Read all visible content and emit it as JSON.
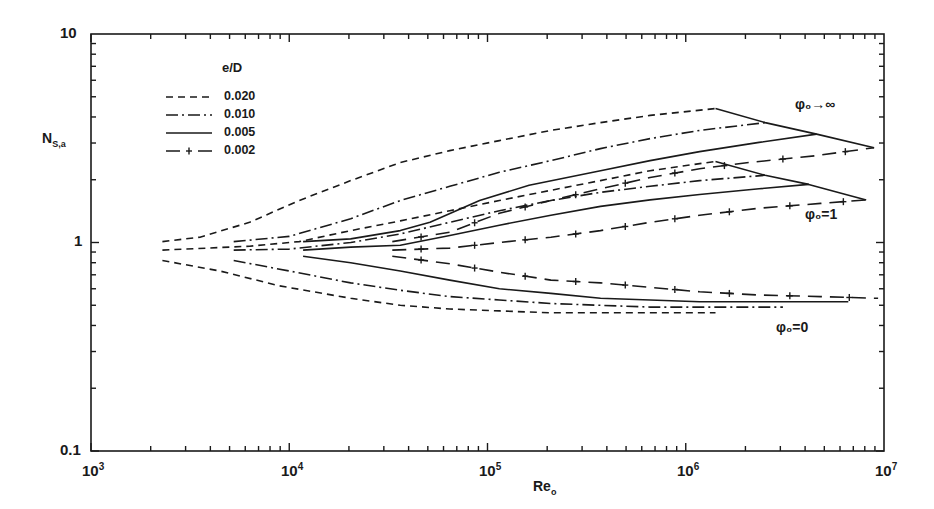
{
  "chart_data": {
    "type": "line",
    "title": "",
    "xlabel": "Re_o",
    "ylabel": "N_S,a",
    "xscale": "log",
    "yscale": "log",
    "xlim": [
      1000,
      10000000
    ],
    "ylim": [
      0.1,
      10
    ],
    "grid": false,
    "x_tick_labels": [
      "10^3",
      "10^4",
      "10^5",
      "10^6",
      "10^7"
    ],
    "y_tick_labels": [
      "0.1",
      "1",
      "10"
    ],
    "legend": {
      "title": "e/D",
      "position": "upper-left",
      "entries": [
        {
          "label": "0.020",
          "style": "dashed"
        },
        {
          "label": "0.010",
          "style": "dashdot"
        },
        {
          "label": "0.005",
          "style": "solid"
        },
        {
          "label": "0.002",
          "style": "dash-plus"
        }
      ]
    },
    "annotations": [
      {
        "text": "φo→∞",
        "near": "upper curve family"
      },
      {
        "text": "φo=1",
        "near": "middle curve family"
      },
      {
        "text": "φo=0",
        "near": "lower curve family"
      }
    ],
    "series": [
      {
        "name": "φo→∞, e/D=0.020",
        "style": "dashed",
        "logRe": [
          3.36,
          3.55,
          3.8,
          4.05,
          4.31,
          4.56,
          4.81,
          5.06,
          5.32,
          5.57,
          5.82,
          6.15
        ],
        "N": [
          1.01,
          1.06,
          1.25,
          1.59,
          1.98,
          2.42,
          2.76,
          3.08,
          3.45,
          3.76,
          4.07,
          4.39
        ]
      },
      {
        "name": "φo→∞, e/D=0.010",
        "style": "dashdot",
        "logRe": [
          3.72,
          4.0,
          4.31,
          4.56,
          4.81,
          5.06,
          5.32,
          5.57,
          5.82,
          6.07,
          6.4
        ],
        "N": [
          1.01,
          1.07,
          1.3,
          1.59,
          1.86,
          2.17,
          2.47,
          2.82,
          3.15,
          3.45,
          3.76
        ]
      },
      {
        "name": "φo→∞, e/D=0.005",
        "style": "solid",
        "logRe": [
          4.07,
          4.31,
          4.56,
          4.71,
          4.96,
          5.21,
          5.57,
          5.82,
          6.07,
          6.37,
          6.66
        ],
        "N": [
          1.01,
          1.04,
          1.14,
          1.25,
          1.59,
          1.88,
          2.21,
          2.47,
          2.73,
          3.02,
          3.31
        ]
      },
      {
        "name": "φo→∞, e/D=0.002",
        "style": "dash-plus",
        "logRe": [
          4.52,
          4.81,
          5.06,
          5.32,
          5.57,
          5.82,
          6.07,
          6.32,
          6.66,
          6.95
        ],
        "N": [
          1.01,
          1.12,
          1.38,
          1.59,
          1.81,
          2.05,
          2.26,
          2.42,
          2.61,
          2.85
        ]
      },
      {
        "name": "φo=1, e/D=0.020",
        "style": "dashed",
        "logRe": [
          3.36,
          3.8,
          4.05,
          4.31,
          4.56,
          4.81,
          5.06,
          5.32,
          5.57,
          5.82,
          6.15
        ],
        "N": [
          0.92,
          0.96,
          1.01,
          1.14,
          1.27,
          1.42,
          1.59,
          1.78,
          1.98,
          2.21,
          2.45
        ]
      },
      {
        "name": "φo=1, e/D=0.010",
        "style": "dashdot",
        "logRe": [
          3.72,
          4.0,
          4.31,
          4.56,
          4.81,
          5.06,
          5.32,
          5.57,
          5.82,
          6.07,
          6.4
        ],
        "N": [
          0.92,
          0.93,
          1.0,
          1.1,
          1.25,
          1.42,
          1.59,
          1.74,
          1.86,
          1.98,
          2.1
        ]
      },
      {
        "name": "φo=1, e/D=0.005",
        "style": "solid",
        "logRe": [
          4.07,
          4.31,
          4.56,
          4.81,
          5.06,
          5.32,
          5.57,
          5.82,
          6.07,
          6.37,
          6.62
        ],
        "N": [
          0.92,
          0.95,
          0.97,
          1.08,
          1.21,
          1.35,
          1.49,
          1.6,
          1.7,
          1.81,
          1.9
        ]
      },
      {
        "name": "φo=1, e/D=0.002",
        "style": "dash-plus",
        "logRe": [
          4.52,
          4.81,
          5.06,
          5.32,
          5.57,
          5.82,
          6.07,
          6.37,
          6.68,
          6.91
        ],
        "N": [
          0.92,
          0.94,
          1.0,
          1.06,
          1.14,
          1.25,
          1.35,
          1.46,
          1.54,
          1.6
        ]
      },
      {
        "name": "φo=0, e/D=0.020",
        "style": "dashed",
        "logRe": [
          3.36,
          3.65,
          3.95,
          4.31,
          4.56,
          4.81,
          5.06,
          5.32,
          5.57,
          6.15
        ],
        "N": [
          0.82,
          0.73,
          0.62,
          0.54,
          0.5,
          0.48,
          0.47,
          0.46,
          0.46,
          0.46
        ]
      },
      {
        "name": "φo=0, e/D=0.010",
        "style": "dashdot",
        "logRe": [
          3.72,
          4.0,
          4.31,
          4.56,
          4.81,
          5.06,
          5.32,
          5.57,
          5.82,
          6.07,
          6.49
        ],
        "N": [
          0.82,
          0.73,
          0.64,
          0.59,
          0.55,
          0.53,
          0.51,
          0.5,
          0.49,
          0.49,
          0.49
        ]
      },
      {
        "name": "φo=0, e/D=0.005",
        "style": "solid",
        "logRe": [
          4.07,
          4.31,
          4.56,
          4.81,
          5.06,
          5.32,
          5.57,
          5.82,
          6.07,
          6.37,
          6.82
        ],
        "N": [
          0.86,
          0.8,
          0.73,
          0.66,
          0.6,
          0.57,
          0.54,
          0.53,
          0.52,
          0.52,
          0.52
        ]
      },
      {
        "name": "φo=0, e/D=0.002",
        "style": "dash-plus",
        "logRe": [
          4.52,
          4.81,
          5.06,
          5.32,
          5.57,
          5.82,
          6.07,
          6.37,
          6.68,
          6.97
        ],
        "N": [
          0.86,
          0.79,
          0.72,
          0.66,
          0.64,
          0.61,
          0.58,
          0.56,
          0.55,
          0.54
        ]
      }
    ],
    "connectors": [
      {
        "name": "φo→∞ envelope",
        "style": "solid",
        "logRe": [
          6.15,
          6.4,
          6.66,
          6.95
        ],
        "N": [
          4.39,
          3.76,
          3.31,
          2.85
        ]
      },
      {
        "name": "φo=1 envelope",
        "style": "solid",
        "logRe": [
          6.15,
          6.4,
          6.62,
          6.91
        ],
        "N": [
          2.45,
          2.1,
          1.9,
          1.6
        ]
      }
    ]
  },
  "axes": {
    "y_title_main": "N",
    "y_title_sub": "S,a",
    "x_title_main": "Re",
    "x_title_sub": "o",
    "y_ticks": [
      {
        "label": "10",
        "value": 10
      },
      {
        "label": "1",
        "value": 1
      },
      {
        "label": "0.1",
        "value": 0.1
      }
    ],
    "x_ticks": [
      {
        "base": "10",
        "exp": "3"
      },
      {
        "base": "10",
        "exp": "4"
      },
      {
        "base": "10",
        "exp": "5"
      },
      {
        "base": "10",
        "exp": "6"
      },
      {
        "base": "10",
        "exp": "7"
      }
    ]
  },
  "legend": {
    "title": "e/D",
    "items": [
      {
        "label": "0.020"
      },
      {
        "label": "0.010"
      },
      {
        "label": "0.005"
      },
      {
        "label": "0.002"
      }
    ]
  },
  "annotations": {
    "phi_inf": "φ₀→∞",
    "phi_one": "φ₀=1",
    "phi_zero": "φ₀=0"
  },
  "colors": {
    "ink": "#1a1a1a",
    "background": "#ffffff"
  }
}
